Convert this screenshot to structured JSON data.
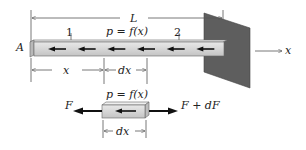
{
  "diagram": {
    "labels": {
      "length": "L",
      "end_point": "A",
      "section_1": "1",
      "section_2": "2",
      "load_top": "p = f(x)",
      "position": "x",
      "increment": "dx",
      "axis": "x",
      "load_element": "p = f(x)",
      "element_dx": "dx",
      "force_left": "F",
      "force_right": "F + dF"
    },
    "bar_load_arrow_count": 6,
    "element_load_arrow_count": 1,
    "colors": {
      "bar_fill": "#d2d2d2",
      "wall_fill": "#5a5a5a",
      "line": "#555555",
      "arrow": "#111111"
    }
  }
}
